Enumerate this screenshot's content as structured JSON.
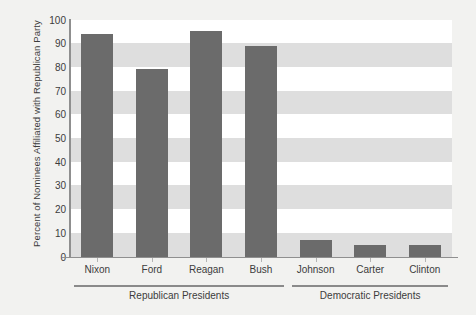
{
  "chart_data": {
    "type": "bar",
    "title": "",
    "subtitle": "",
    "xlabel": "",
    "ylabel": "Percent of Nominees Affiliated with Republican Party",
    "categories": [
      "Nixon",
      "Ford",
      "Reagan",
      "Bush",
      "Johnson",
      "Carter",
      "Clinton"
    ],
    "values": [
      94,
      79,
      95,
      89,
      7,
      5,
      5
    ],
    "ylim": [
      0,
      100
    ],
    "ytick_labels": [
      "0",
      "10",
      "20",
      "30",
      "40",
      "50",
      "60",
      "70",
      "80",
      "90",
      "100"
    ],
    "ytick_values": [
      0,
      10,
      20,
      30,
      40,
      50,
      60,
      70,
      80,
      90,
      100
    ],
    "grid": "alternating-horizontal-bands",
    "legend": "none",
    "groups": [
      {
        "label": "Republican Presidents",
        "categories": [
          "Nixon",
          "Ford",
          "Reagan",
          "Bush"
        ]
      },
      {
        "label": "Democratic Presidents",
        "categories": [
          "Johnson",
          "Carter",
          "Clinton"
        ]
      }
    ],
    "colors": {
      "bar": "#6b6b6b",
      "band": "#dedede",
      "plot_background": "#ffffff",
      "figure_background": "#f2f2f0",
      "axis": "#8f8f8f",
      "text": "#3c3c3c"
    }
  }
}
